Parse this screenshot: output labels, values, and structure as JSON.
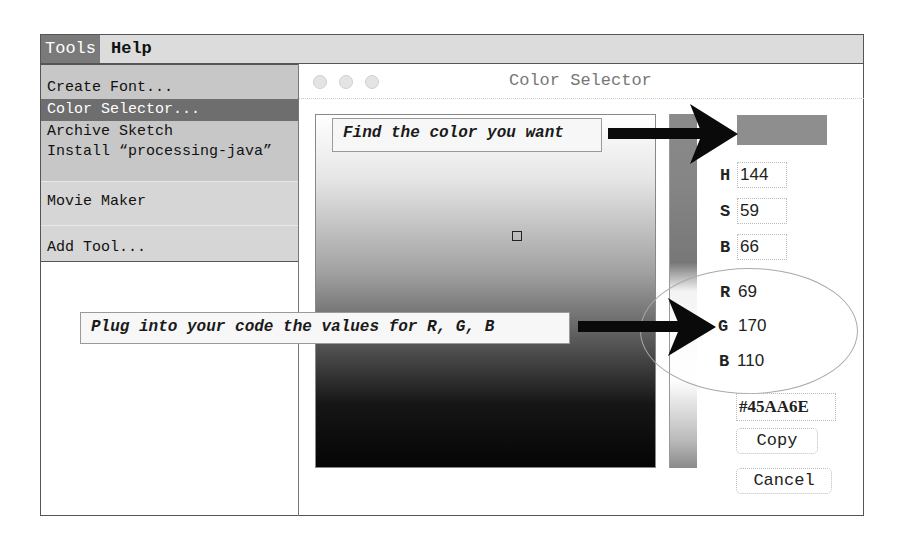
{
  "menubar": {
    "items": [
      {
        "label": "Tools",
        "active": true
      },
      {
        "label": "Help",
        "active": false
      }
    ]
  },
  "tools_menu": {
    "items": [
      {
        "label": "Create Font..."
      },
      {
        "label": "Color Selector...",
        "selected": true
      },
      {
        "label": "Archive Sketch"
      },
      {
        "label": "Install “processing-java”"
      },
      {
        "label": "Movie Maker"
      },
      {
        "label": "Add Tool..."
      }
    ]
  },
  "dialog": {
    "title": "Color Selector",
    "swatch_color": "#45AA6E",
    "fields": {
      "H": {
        "label": "H",
        "value": "144"
      },
      "S": {
        "label": "S",
        "value": "59"
      },
      "B": {
        "label": "B",
        "value": "66"
      },
      "R": {
        "label": "R",
        "value": "69"
      },
      "G": {
        "label": "G",
        "value": "170"
      },
      "B2": {
        "label": "B",
        "value": "110"
      }
    },
    "hex_value": "#45AA6E",
    "copy_label": "Copy",
    "cancel_label": "Cancel"
  },
  "annotations": {
    "find_color": "Find the color you want",
    "plug_values": "Plug into your code the values for R, G, B"
  }
}
